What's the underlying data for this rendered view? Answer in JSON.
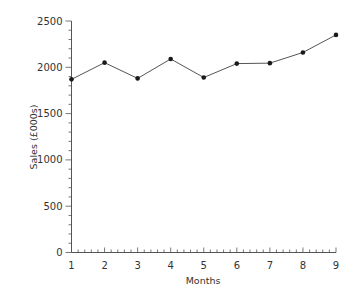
{
  "chart_data": {
    "type": "line",
    "title": "",
    "xlabel": "Months",
    "ylabel": "Sales (£000s)",
    "x": [
      1,
      2,
      3,
      4,
      5,
      6,
      7,
      8,
      9
    ],
    "categories": [
      "1",
      "2",
      "3",
      "4",
      "5",
      "6",
      "7",
      "8",
      "9"
    ],
    "series": [
      {
        "name": "Sales",
        "values": [
          1870,
          2050,
          1880,
          2090,
          1890,
          2040,
          2045,
          2160,
          2350
        ]
      }
    ],
    "xlim": [
      1,
      9
    ],
    "ylim": [
      0,
      2500
    ],
    "yticks": [
      0,
      500,
      1000,
      1500,
      2000,
      2500
    ],
    "xticks": [
      1,
      2,
      3,
      4,
      5,
      6,
      7,
      8,
      9
    ],
    "y_minor_ticks_per_major": 5,
    "x_minor_ticks_per_major": 5,
    "grid": false,
    "legend": null,
    "colors": {
      "line": "#555555",
      "marker": "#1a1a1a",
      "axis": "#555555",
      "text": "#333333"
    }
  }
}
